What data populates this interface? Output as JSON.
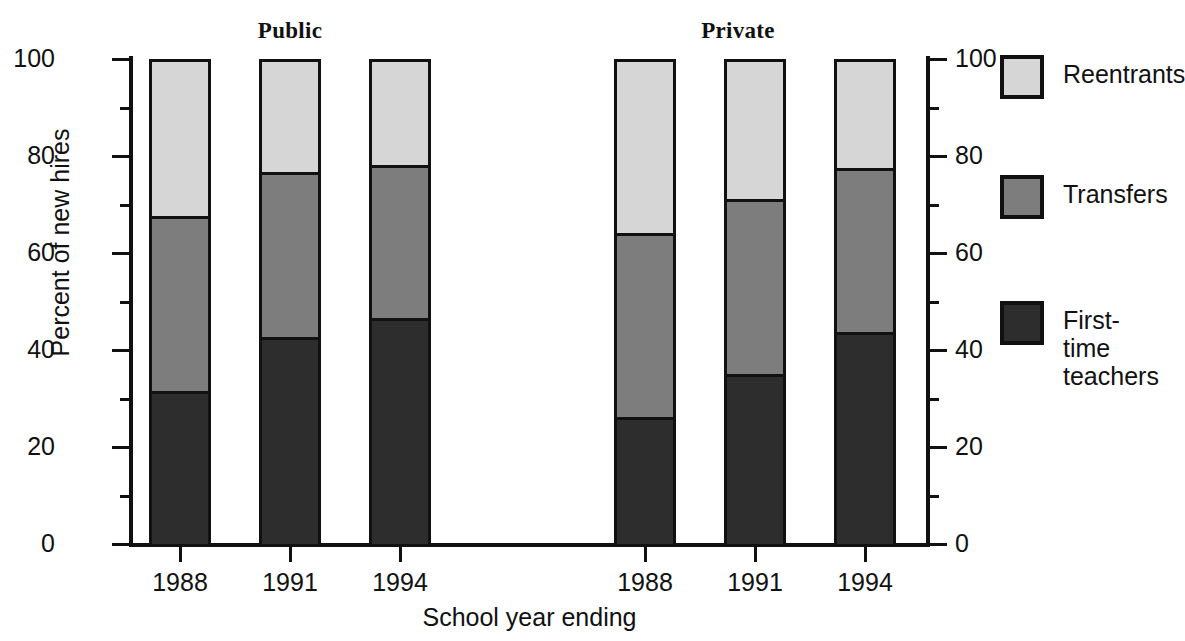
{
  "chart_data": {
    "type": "bar",
    "subtype": "stacked-percent",
    "title": "",
    "xlabel": "School year ending",
    "ylabel": "Percent of new hires",
    "ylim": [
      0,
      100
    ],
    "yticks": [
      0,
      20,
      40,
      60,
      80,
      100
    ],
    "ytick_labels": [
      "0",
      "20",
      "40",
      "60",
      "80",
      "100"
    ],
    "yminor_ticks": [
      10,
      30,
      50,
      70,
      90
    ],
    "grid": false,
    "dual_y_axis": true,
    "legend_position": "right",
    "group_titles": [
      "Public",
      "Private"
    ],
    "categories": [
      "1988",
      "1991",
      "1994",
      "1988",
      "1991",
      "1994"
    ],
    "groups": [
      {
        "name": "Public",
        "categories": [
          "1988",
          "1991",
          "1994"
        ],
        "series": [
          {
            "name": "First-time teachers",
            "values": [
              31,
              42,
              46
            ]
          },
          {
            "name": "Transfers",
            "values": [
              36,
              34,
              31.5
            ]
          },
          {
            "name": "Reentrants",
            "values": [
              33,
              24,
              22.5
            ]
          }
        ],
        "cumulative_tops": [
          {
            "first_time": 31,
            "transfers": 67,
            "reentrants": 100
          },
          {
            "first_time": 42,
            "transfers": 76,
            "reentrants": 100
          },
          {
            "first_time": 46,
            "transfers": 77.5,
            "reentrants": 100
          }
        ]
      },
      {
        "name": "Private",
        "categories": [
          "1988",
          "1991",
          "1994"
        ],
        "series": [
          {
            "name": "First-time teachers",
            "values": [
              25.5,
              34.5,
              43
            ]
          },
          {
            "name": "Transfers",
            "values": [
              38,
              36,
              34
            ]
          },
          {
            "name": "Reentrants",
            "values": [
              36.5,
              29.5,
              23
            ]
          }
        ],
        "cumulative_tops": [
          {
            "first_time": 25.5,
            "transfers": 63.5,
            "reentrants": 100
          },
          {
            "first_time": 34.5,
            "transfers": 70.5,
            "reentrants": 100
          },
          {
            "first_time": 43,
            "transfers": 77,
            "reentrants": 100
          }
        ]
      }
    ],
    "series_colors": {
      "First-time teachers": "#2d2d2d",
      "Transfers": "#7d7d7d",
      "Reentrants": "#d6d6d6"
    }
  },
  "axes": {
    "ylabel": "Percent of new hires",
    "xlabel": "School year ending",
    "ytick_labels": [
      "100",
      "80",
      "60",
      "40",
      "20",
      "0"
    ],
    "xtick_labels": [
      "1988",
      "1991",
      "1994",
      "1988",
      "1991",
      "1994"
    ]
  },
  "headings": {
    "public": "Public",
    "private": "Private"
  },
  "legend": {
    "items": [
      {
        "label": "Reentrants",
        "color": "#d6d6d6"
      },
      {
        "label": "Transfers",
        "color": "#7d7d7d"
      },
      {
        "label": "First-time\nteachers",
        "color": "#2d2d2d"
      }
    ]
  }
}
